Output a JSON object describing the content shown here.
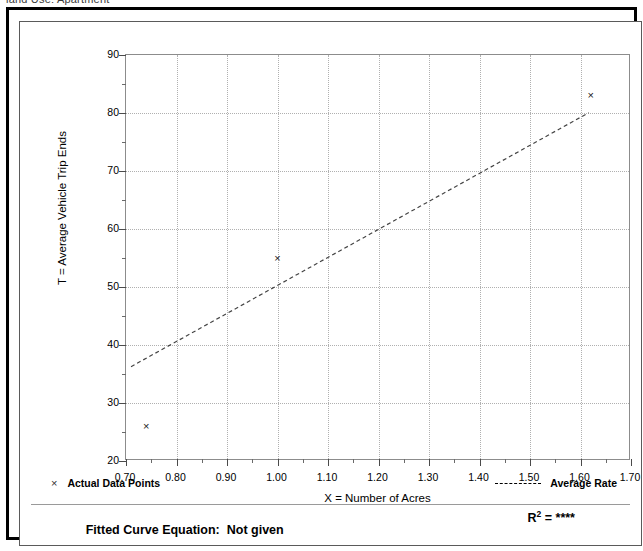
{
  "page": {
    "clipped_top_text": "land Use: Apartment"
  },
  "chart_data": {
    "type": "scatter",
    "title": "",
    "xlabel": "X = Number of Acres",
    "ylabel": "T = Average Vehicle Trip Ends",
    "xlim": [
      0.7,
      1.7
    ],
    "ylim": [
      20,
      90
    ],
    "xticks": [
      "0.70",
      "0.80",
      "0.90",
      "1.00",
      "1.10",
      "1.20",
      "1.30",
      "1.40",
      "1.50",
      "1.60",
      "1.70"
    ],
    "xtick_values": [
      0.7,
      0.8,
      0.9,
      1.0,
      1.1,
      1.2,
      1.3,
      1.4,
      1.5,
      1.6,
      1.7
    ],
    "yticks": [
      "20",
      "30",
      "40",
      "50",
      "60",
      "70",
      "80",
      "90"
    ],
    "ytick_values": [
      20,
      30,
      40,
      50,
      60,
      70,
      80,
      90
    ],
    "x_minor_step": 0.05,
    "y_minor_step": 5,
    "grid": true,
    "legend_position": "below-plot",
    "series": [
      {
        "name": "Actual Data Points",
        "marker": "x",
        "type": "scatter",
        "points": [
          {
            "x": 0.74,
            "y": 26
          },
          {
            "x": 1.0,
            "y": 55
          },
          {
            "x": 1.62,
            "y": 83
          }
        ]
      },
      {
        "name": "Average Rate",
        "type": "line",
        "style": "dashed",
        "endpoints": [
          {
            "x": 0.71,
            "y": 36
          },
          {
            "x": 1.62,
            "y": 80
          }
        ]
      }
    ],
    "annotations": {
      "fitted_curve_label": "Fitted Curve Equation:",
      "fitted_curve_value": "Not given",
      "r_squared_label": "R",
      "r_squared_exponent": "2",
      "r_squared_equals": "=",
      "r_squared_value": "****"
    }
  },
  "legend": {
    "actual_points_marker": "×",
    "actual_points_label": "Actual Data Points",
    "average_rate_label": "Average Rate"
  }
}
